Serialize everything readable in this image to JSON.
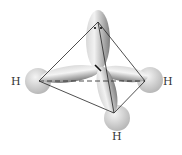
{
  "diagram": {
    "type": "molecular-orbital-geometry",
    "geometry": "tetrahedral",
    "center_atom": {
      "x": 98,
      "y": 68
    },
    "lone_pair": {
      "symbol": "••",
      "x": 98,
      "y": 27
    },
    "atoms": [
      {
        "label": "H",
        "label_x": 15,
        "label_y": 85,
        "sphere_x": 38,
        "sphere_y": 81,
        "vertex_x": 39,
        "vertex_y": 81
      },
      {
        "label": "H",
        "label_x": 167,
        "label_y": 85,
        "sphere_x": 150,
        "sphere_y": 80,
        "vertex_x": 145,
        "vertex_y": 81
      },
      {
        "label": "H",
        "label_x": 116,
        "label_y": 139,
        "sphere_x": 117,
        "sphere_y": 118,
        "vertex_x": 114,
        "vertex_y": 113
      }
    ],
    "apex": {
      "x": 98,
      "y": 22
    },
    "colors": {
      "orbital_light": "#e6e6e6",
      "orbital_dark": "#8a8a8a",
      "sphere_light": "#eeeeee",
      "sphere_dark": "#bdbdbd",
      "edge": "#222222",
      "label": "#333333"
    }
  }
}
